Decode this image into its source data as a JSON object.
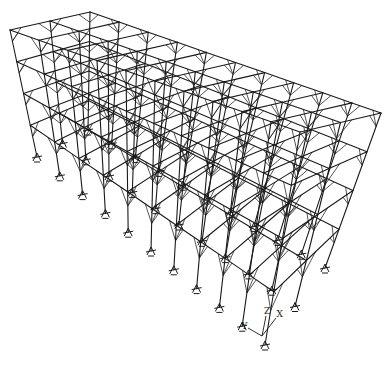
{
  "diagram": {
    "type": "3d-structural-frame-wireframe",
    "bays_length": 10,
    "bays_width": 2,
    "levels": 4,
    "corners": {
      "top": {
        "front_left": [
          10,
          30
        ],
        "back_left": [
          90,
          12
        ],
        "front_right": [
          300,
          132
        ],
        "back_right": [
          381,
          113
        ]
      },
      "base": {
        "front_left": [
          37,
          157
        ],
        "back_left": [
          88,
          130
        ],
        "front_right": [
          265,
          345
        ],
        "back_right": [
          325,
          268
        ]
      }
    },
    "colors": {
      "line": "#1a1a1a",
      "background": "#ffffff"
    }
  },
  "axes": {
    "origin": [
      262,
      336
    ],
    "labels": {
      "x": "X",
      "y": "Y",
      "z": "Z"
    },
    "vectors": {
      "x": [
        14,
        -18
      ],
      "y": [
        -14,
        -8
      ],
      "z": [
        4,
        -20
      ]
    }
  }
}
